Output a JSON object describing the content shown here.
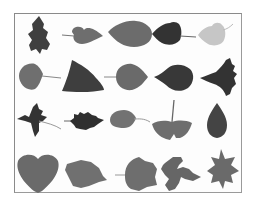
{
  "figure": {
    "rows": 4,
    "columns": 5,
    "colors": {
      "background": "#ffffff",
      "border": "#8a8a8a",
      "leaf_dark": "#3a3a3a",
      "leaf_mid": "#5e5e5e",
      "leaf_gray": "#7a7a7a",
      "leaf_light": "#c4c4c4"
    },
    "leaves": [
      {
        "row": 1,
        "col": 1,
        "shape": "elongated-lobed",
        "tone": "dark"
      },
      {
        "row": 1,
        "col": 2,
        "shape": "heart-with-stem",
        "tone": "gray"
      },
      {
        "row": 1,
        "col": 3,
        "shape": "ovate-pointed",
        "tone": "gray"
      },
      {
        "row": 1,
        "col": 4,
        "shape": "heart-with-stem",
        "tone": "dark"
      },
      {
        "row": 1,
        "col": 5,
        "shape": "heart-with-stem",
        "tone": "light"
      },
      {
        "row": 2,
        "col": 1,
        "shape": "heart-with-stem",
        "tone": "gray"
      },
      {
        "row": 2,
        "col": 2,
        "shape": "triangular",
        "tone": "dark"
      },
      {
        "row": 2,
        "col": 3,
        "shape": "ovate-pointed-with-stem",
        "tone": "gray"
      },
      {
        "row": 2,
        "col": 4,
        "shape": "ovate-pointed",
        "tone": "dark"
      },
      {
        "row": 2,
        "col": 5,
        "shape": "toothed-triangular",
        "tone": "dark"
      },
      {
        "row": 3,
        "col": 1,
        "shape": "maple-like",
        "tone": "dark"
      },
      {
        "row": 3,
        "col": 2,
        "shape": "wavy-ovate",
        "tone": "dark"
      },
      {
        "row": 3,
        "col": 3,
        "shape": "small-ovate-with-stem",
        "tone": "gray"
      },
      {
        "row": 3,
        "col": 4,
        "shape": "ginkgo-fan",
        "tone": "gray"
      },
      {
        "row": 3,
        "col": 5,
        "shape": "teardrop",
        "tone": "dark"
      },
      {
        "row": 4,
        "col": 1,
        "shape": "heart",
        "tone": "gray"
      },
      {
        "row": 4,
        "col": 2,
        "shape": "rounded-oblong",
        "tone": "gray"
      },
      {
        "row": 4,
        "col": 3,
        "shape": "broad-lobed",
        "tone": "gray"
      },
      {
        "row": 4,
        "col": 4,
        "shape": "deeply-lobed",
        "tone": "gray"
      },
      {
        "row": 4,
        "col": 5,
        "shape": "star-maple",
        "tone": "gray"
      }
    ]
  }
}
